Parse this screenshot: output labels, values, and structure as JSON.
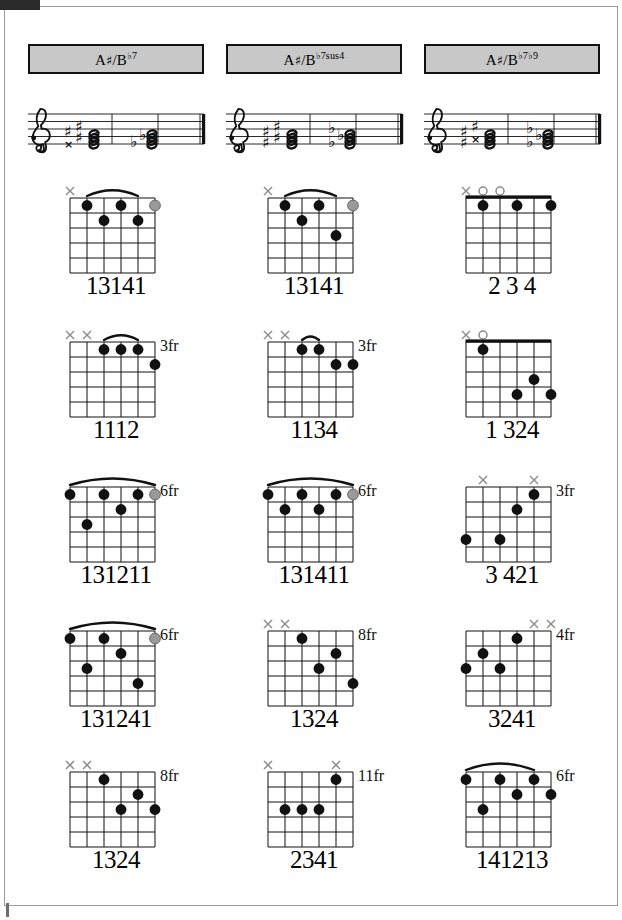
{
  "page": {
    "columns_count": 3,
    "rows_count": 5
  },
  "colors": {
    "header_fill": "#c8c8c8",
    "header_border": "#111111",
    "dot_filled": "#111111",
    "dot_optional": "#9a9a9a",
    "marker": "#8d8d8d",
    "staff_line": "#111111",
    "page_border": "#9a9a9a"
  },
  "columns": [
    {
      "id": "col-bb7",
      "header": {
        "root": "A",
        "root_accidental": "♯",
        "slash": "/",
        "alt_root": "B",
        "alt_accidental": "♭",
        "quality": "7",
        "extension": "",
        "full_label": "A♯/B♭7"
      },
      "staff": {
        "clef": "treble-clef",
        "chord_groups": [
          {
            "spelling": "sharp",
            "accidentals": [
              "x",
              "♯",
              "♯",
              "♯"
            ]
          },
          {
            "spelling": "flat",
            "accidentals": [
              "♭",
              "♭"
            ]
          }
        ],
        "barline": "final-double-barline"
      },
      "diagrams": [
        {
          "row": 1,
          "fingering": "13141",
          "position_label": "",
          "nut": false,
          "barre": {
            "present": true,
            "from_string": 2,
            "to_string": 5,
            "fret": 1
          },
          "markers": [
            {
              "string": 1,
              "type": "mute"
            }
          ],
          "dots": [
            {
              "string": 2,
              "fret": 1,
              "style": "filled"
            },
            {
              "string": 4,
              "fret": 1,
              "style": "filled"
            },
            {
              "string": 6,
              "fret": 1,
              "style": "optional"
            },
            {
              "string": 3,
              "fret": 2,
              "style": "filled"
            },
            {
              "string": 5,
              "fret": 2,
              "style": "filled"
            }
          ]
        },
        {
          "row": 2,
          "fingering": "1112",
          "position_label": "3fr",
          "nut": false,
          "barre": {
            "present": true,
            "from_string": 3,
            "to_string": 5,
            "fret": 1
          },
          "markers": [
            {
              "string": 1,
              "type": "mute"
            },
            {
              "string": 2,
              "type": "mute"
            }
          ],
          "dots": [
            {
              "string": 3,
              "fret": 1,
              "style": "filled"
            },
            {
              "string": 4,
              "fret": 1,
              "style": "filled"
            },
            {
              "string": 5,
              "fret": 1,
              "style": "filled"
            },
            {
              "string": 6,
              "fret": 2,
              "style": "filled"
            }
          ]
        },
        {
          "row": 3,
          "fingering": "131211",
          "position_label": "6fr",
          "nut": false,
          "barre": {
            "present": true,
            "from_string": 1,
            "to_string": 6,
            "fret": 1
          },
          "markers": [],
          "dots": [
            {
              "string": 1,
              "fret": 1,
              "style": "filled"
            },
            {
              "string": 3,
              "fret": 1,
              "style": "filled"
            },
            {
              "string": 5,
              "fret": 1,
              "style": "filled"
            },
            {
              "string": 6,
              "fret": 1,
              "style": "optional"
            },
            {
              "string": 4,
              "fret": 2,
              "style": "filled"
            },
            {
              "string": 2,
              "fret": 3,
              "style": "filled"
            }
          ]
        },
        {
          "row": 4,
          "fingering": "131241",
          "position_label": "6fr",
          "nut": false,
          "barre": {
            "present": true,
            "from_string": 1,
            "to_string": 6,
            "fret": 1
          },
          "markers": [],
          "dots": [
            {
              "string": 1,
              "fret": 1,
              "style": "filled"
            },
            {
              "string": 3,
              "fret": 1,
              "style": "filled"
            },
            {
              "string": 6,
              "fret": 1,
              "style": "optional"
            },
            {
              "string": 4,
              "fret": 2,
              "style": "filled"
            },
            {
              "string": 2,
              "fret": 3,
              "style": "filled"
            },
            {
              "string": 5,
              "fret": 4,
              "style": "filled"
            }
          ]
        },
        {
          "row": 5,
          "fingering": "1324",
          "position_label": "8fr",
          "nut": false,
          "barre": {
            "present": false
          },
          "markers": [
            {
              "string": 1,
              "type": "mute"
            },
            {
              "string": 2,
              "type": "mute"
            }
          ],
          "dots": [
            {
              "string": 3,
              "fret": 1,
              "style": "filled"
            },
            {
              "string": 5,
              "fret": 2,
              "style": "filled"
            },
            {
              "string": 4,
              "fret": 3,
              "style": "filled"
            },
            {
              "string": 6,
              "fret": 3,
              "style": "filled"
            }
          ]
        }
      ]
    },
    {
      "id": "col-bb7sus4",
      "header": {
        "root": "A",
        "root_accidental": "♯",
        "slash": "/",
        "alt_root": "B",
        "alt_accidental": "♭",
        "quality": "7sus",
        "extension": "4",
        "full_label": "A♯/B♭7sus4"
      },
      "staff": {
        "clef": "treble-clef",
        "chord_groups": [
          {
            "spelling": "sharp",
            "accidentals": [
              "♯",
              "♯",
              "♯",
              "♯"
            ]
          },
          {
            "spelling": "flat",
            "accidentals": [
              "♭",
              "♭",
              "♭"
            ]
          }
        ],
        "barline": "final-double-barline"
      },
      "diagrams": [
        {
          "row": 1,
          "fingering": "13141",
          "position_label": "",
          "nut": false,
          "barre": {
            "present": true,
            "from_string": 2,
            "to_string": 5,
            "fret": 1
          },
          "markers": [
            {
              "string": 1,
              "type": "mute"
            }
          ],
          "dots": [
            {
              "string": 2,
              "fret": 1,
              "style": "filled"
            },
            {
              "string": 4,
              "fret": 1,
              "style": "filled"
            },
            {
              "string": 6,
              "fret": 1,
              "style": "optional"
            },
            {
              "string": 3,
              "fret": 2,
              "style": "filled"
            },
            {
              "string": 5,
              "fret": 3,
              "style": "filled"
            }
          ]
        },
        {
          "row": 2,
          "fingering": "1134",
          "position_label": "3fr",
          "nut": false,
          "barre": {
            "present": true,
            "from_string": 3,
            "to_string": 4,
            "fret": 1
          },
          "markers": [
            {
              "string": 1,
              "type": "mute"
            },
            {
              "string": 2,
              "type": "mute"
            }
          ],
          "dots": [
            {
              "string": 3,
              "fret": 1,
              "style": "filled"
            },
            {
              "string": 4,
              "fret": 1,
              "style": "filled"
            },
            {
              "string": 5,
              "fret": 2,
              "style": "filled"
            },
            {
              "string": 6,
              "fret": 2,
              "style": "filled"
            }
          ]
        },
        {
          "row": 3,
          "fingering": "131411",
          "position_label": "6fr",
          "nut": false,
          "barre": {
            "present": true,
            "from_string": 1,
            "to_string": 6,
            "fret": 1
          },
          "markers": [],
          "dots": [
            {
              "string": 1,
              "fret": 1,
              "style": "filled"
            },
            {
              "string": 3,
              "fret": 1,
              "style": "filled"
            },
            {
              "string": 5,
              "fret": 1,
              "style": "filled"
            },
            {
              "string": 6,
              "fret": 1,
              "style": "optional"
            },
            {
              "string": 2,
              "fret": 2,
              "style": "filled"
            },
            {
              "string": 4,
              "fret": 2,
              "style": "filled"
            }
          ]
        },
        {
          "row": 4,
          "fingering": "1324",
          "position_label": "8fr",
          "nut": false,
          "barre": {
            "present": false
          },
          "markers": [
            {
              "string": 1,
              "type": "mute"
            },
            {
              "string": 2,
              "type": "mute"
            }
          ],
          "dots": [
            {
              "string": 3,
              "fret": 1,
              "style": "filled"
            },
            {
              "string": 5,
              "fret": 2,
              "style": "filled"
            },
            {
              "string": 4,
              "fret": 3,
              "style": "filled"
            },
            {
              "string": 6,
              "fret": 4,
              "style": "filled"
            }
          ]
        },
        {
          "row": 5,
          "fingering": "2341",
          "position_label": "11fr",
          "nut": false,
          "barre": {
            "present": false
          },
          "markers": [
            {
              "string": 1,
              "type": "mute"
            },
            {
              "string": 5,
              "type": "mute"
            }
          ],
          "dots": [
            {
              "string": 5,
              "fret": 1,
              "style": "filled"
            },
            {
              "string": 2,
              "fret": 3,
              "style": "filled"
            },
            {
              "string": 3,
              "fret": 3,
              "style": "filled"
            },
            {
              "string": 4,
              "fret": 3,
              "style": "filled"
            }
          ]
        }
      ]
    },
    {
      "id": "col-bb7b9",
      "header": {
        "root": "A",
        "root_accidental": "♯",
        "slash": "/",
        "alt_root": "B",
        "alt_accidental": "♭",
        "quality": "7",
        "extension": "♭9",
        "full_label": "A♯/B♭7♭9"
      },
      "staff": {
        "clef": "treble-clef",
        "chord_groups": [
          {
            "spelling": "sharp",
            "accidentals": [
              "♯",
              "x",
              "♯",
              "♯"
            ]
          },
          {
            "spelling": "flat",
            "accidentals": [
              "♭",
              "♭",
              "♭"
            ]
          }
        ],
        "barline": "final-double-barline"
      },
      "diagrams": [
        {
          "row": 1,
          "fingering": "2 3 4",
          "position_label": "",
          "nut": true,
          "barre": {
            "present": false
          },
          "markers": [
            {
              "string": 1,
              "type": "mute"
            },
            {
              "string": 2,
              "type": "open"
            },
            {
              "string": 3,
              "type": "open"
            }
          ],
          "dots": [
            {
              "string": 2,
              "fret": 1,
              "style": "filled"
            },
            {
              "string": 4,
              "fret": 1,
              "style": "filled"
            },
            {
              "string": 6,
              "fret": 1,
              "style": "filled"
            }
          ]
        },
        {
          "row": 2,
          "fingering": "1  324",
          "position_label": "",
          "nut": true,
          "barre": {
            "present": false
          },
          "markers": [
            {
              "string": 1,
              "type": "mute"
            },
            {
              "string": 2,
              "type": "open"
            }
          ],
          "dots": [
            {
              "string": 2,
              "fret": 1,
              "style": "filled"
            },
            {
              "string": 5,
              "fret": 3,
              "style": "filled"
            },
            {
              "string": 4,
              "fret": 4,
              "style": "filled"
            },
            {
              "string": 6,
              "fret": 4,
              "style": "filled"
            }
          ]
        },
        {
          "row": 3,
          "fingering": "3  421",
          "position_label": "3fr",
          "nut": false,
          "barre": {
            "present": false
          },
          "markers": [
            {
              "string": 2,
              "type": "mute"
            },
            {
              "string": 5,
              "type": "mute"
            }
          ],
          "dots": [
            {
              "string": 5,
              "fret": 1,
              "style": "filled"
            },
            {
              "string": 4,
              "fret": 2,
              "style": "filled"
            },
            {
              "string": 1,
              "fret": 4,
              "style": "filled"
            },
            {
              "string": 3,
              "fret": 4,
              "style": "filled"
            }
          ]
        },
        {
          "row": 4,
          "fingering": "3241",
          "position_label": "4fr",
          "nut": false,
          "barre": {
            "present": false
          },
          "markers": [
            {
              "string": 5,
              "type": "mute"
            },
            {
              "string": 6,
              "type": "mute"
            }
          ],
          "dots": [
            {
              "string": 4,
              "fret": 1,
              "style": "filled"
            },
            {
              "string": 2,
              "fret": 2,
              "style": "filled"
            },
            {
              "string": 1,
              "fret": 3,
              "style": "filled"
            },
            {
              "string": 3,
              "fret": 3,
              "style": "filled"
            }
          ]
        },
        {
          "row": 5,
          "fingering": "141213",
          "position_label": "6fr",
          "nut": false,
          "barre": {
            "present": true,
            "from_string": 1,
            "to_string": 5,
            "fret": 1
          },
          "markers": [],
          "dots": [
            {
              "string": 1,
              "fret": 1,
              "style": "filled"
            },
            {
              "string": 3,
              "fret": 1,
              "style": "filled"
            },
            {
              "string": 5,
              "fret": 1,
              "style": "filled"
            },
            {
              "string": 4,
              "fret": 2,
              "style": "filled"
            },
            {
              "string": 6,
              "fret": 2,
              "style": "filled"
            },
            {
              "string": 2,
              "fret": 3,
              "style": "filled"
            }
          ]
        }
      ]
    }
  ],
  "layout": {
    "row_tops": [
      184,
      328,
      473,
      617,
      758
    ],
    "grid": {
      "strings": 6,
      "frets": 5,
      "string_spacing": 17,
      "fret_spacing": 15,
      "origin_x": 52,
      "origin_y": 14
    }
  }
}
